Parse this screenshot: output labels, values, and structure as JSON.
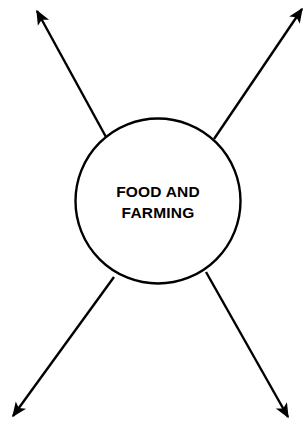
{
  "diagram": {
    "background_color": "#ffffff",
    "stroke_color": "#000000",
    "stroke_width": 2.4,
    "central_node": {
      "shape": "circle",
      "label_line_1": "FOOD AND",
      "label_line_2": "FARMING",
      "cx": 158,
      "cy": 201,
      "r": 83,
      "fill": "#ffffff",
      "stroke": "#000000"
    },
    "arrows": [
      {
        "name": "arrow-top-left",
        "direction": "up-left",
        "from_x": 106,
        "from_y": 137,
        "to_x": 36,
        "to_y": 10,
        "arrowhead": "filled-triangle"
      },
      {
        "name": "arrow-top-right",
        "direction": "up-right",
        "from_x": 214,
        "from_y": 139,
        "to_x": 303,
        "to_y": 8,
        "arrowhead": "filled-triangle"
      },
      {
        "name": "arrow-bottom-left",
        "direction": "down-left",
        "from_x": 114,
        "from_y": 277,
        "to_x": 12,
        "to_y": 417,
        "arrowhead": "filled-triangle"
      },
      {
        "name": "arrow-bottom-right",
        "direction": "down-right",
        "from_x": 206,
        "from_y": 272,
        "to_x": 289,
        "to_y": 418,
        "arrowhead": "filled-triangle"
      }
    ],
    "label_positions": {
      "line_1_y": 193,
      "line_2_y": 214,
      "center_x": 158
    }
  }
}
